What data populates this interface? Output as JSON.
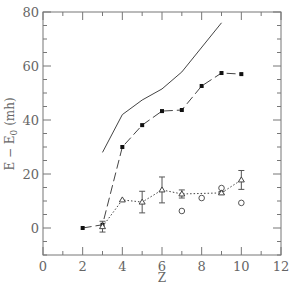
{
  "chart_data": {
    "type": "line",
    "title": "",
    "xlabel": "Z",
    "ylabel": "E − E0 (mh)",
    "xlim": [
      0,
      12
    ],
    "ylim": [
      -10,
      80
    ],
    "xticks": [
      0,
      2,
      4,
      6,
      8,
      10,
      12
    ],
    "yticks": [
      0,
      20,
      40,
      60,
      80
    ],
    "grid": false,
    "legend": null,
    "series": [
      {
        "name": "solid-line",
        "style": "solid",
        "marker": "none",
        "x": [
          3,
          4,
          5,
          6,
          7,
          9
        ],
        "y": [
          28,
          42,
          47.4,
          51.5,
          57.8,
          76
        ]
      },
      {
        "name": "filled-squares",
        "style": "dashed",
        "marker": "filled-square",
        "x": [
          2,
          3,
          4,
          5,
          6,
          7,
          8,
          9,
          10
        ],
        "y": [
          0,
          1.2,
          30,
          38.1,
          43.3,
          43.7,
          52.6,
          57.4,
          57
        ]
      },
      {
        "name": "open-triangles",
        "style": "dotted",
        "marker": "open-triangle",
        "x": [
          3,
          4,
          5,
          6,
          7,
          9,
          10
        ],
        "y": [
          0.5,
          10.4,
          9.6,
          14.1,
          12.6,
          13,
          17.8
        ],
        "yerr": [
          2,
          0,
          4,
          4.8,
          1.5,
          0.5,
          3.5
        ]
      },
      {
        "name": "open-circles",
        "style": "none",
        "marker": "open-circle",
        "x": [
          7,
          8,
          9,
          10
        ],
        "y": [
          6.3,
          11.1,
          14.8,
          9.3
        ]
      }
    ]
  },
  "labels": {
    "x": "Z",
    "y_main": "E − E",
    "y_sub": "0",
    "y_unit": " (mh)"
  }
}
